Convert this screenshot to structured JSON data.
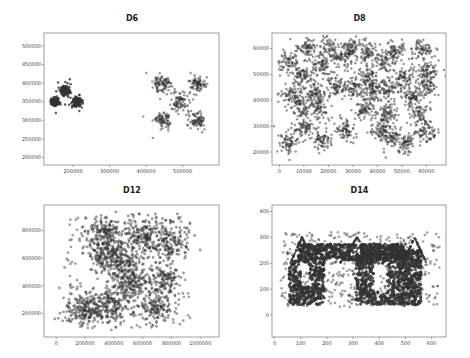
{
  "chart_data": [
    {
      "type": "scatter",
      "title": "D6",
      "xlabel": "",
      "ylabel": "",
      "xlim": [
        120000,
        600000
      ],
      "ylim": [
        180000,
        535000
      ],
      "xticks": [
        200000,
        300000,
        400000,
        500000
      ],
      "yticks": [
        200000,
        250000,
        300000,
        350000,
        400000,
        450000,
        500000
      ],
      "grid": false,
      "clusters": [
        {
          "cx": 150000,
          "cy": 350000,
          "sx": 6000,
          "sy": 6000,
          "n": 120
        },
        {
          "cx": 180000,
          "cy": 380000,
          "sx": 6000,
          "sy": 6000,
          "n": 120
        },
        {
          "cx": 210000,
          "cy": 350000,
          "sx": 6000,
          "sy": 6000,
          "n": 120
        },
        {
          "cx": 445000,
          "cy": 397000,
          "sx": 12000,
          "sy": 12000,
          "n": 90
        },
        {
          "cx": 540000,
          "cy": 400000,
          "sx": 11000,
          "sy": 11000,
          "n": 80
        },
        {
          "cx": 493000,
          "cy": 350000,
          "sx": 12000,
          "sy": 12000,
          "n": 80
        },
        {
          "cx": 445000,
          "cy": 300000,
          "sx": 11000,
          "sy": 11000,
          "n": 80
        },
        {
          "cx": 540000,
          "cy": 300000,
          "sx": 11000,
          "sy": 11000,
          "n": 80
        }
      ]
    },
    {
      "type": "scatter",
      "title": "D8",
      "xlabel": "",
      "ylabel": "",
      "xlim": [
        -3000,
        68000
      ],
      "ylim": [
        15000,
        66000
      ],
      "xticks": [
        0,
        10000,
        20000,
        30000,
        40000,
        50000,
        60000
      ],
      "yticks": [
        20000,
        30000,
        40000,
        50000,
        60000
      ],
      "grid": false,
      "clusters": [
        {
          "cx": 11000,
          "cy": 60000,
          "sx": 2000,
          "sy": 2000,
          "n": 70
        },
        {
          "cx": 20000,
          "cy": 60000,
          "sx": 2000,
          "sy": 2000,
          "n": 70
        },
        {
          "cx": 29000,
          "cy": 60000,
          "sx": 2000,
          "sy": 2000,
          "n": 70
        },
        {
          "cx": 26000,
          "cy": 56500,
          "sx": 2000,
          "sy": 2000,
          "n": 60
        },
        {
          "cx": 36000,
          "cy": 58000,
          "sx": 2000,
          "sy": 2000,
          "n": 70
        },
        {
          "cx": 47000,
          "cy": 59000,
          "sx": 2000,
          "sy": 2000,
          "n": 70
        },
        {
          "cx": 58000,
          "cy": 59000,
          "sx": 2000,
          "sy": 2000,
          "n": 70
        },
        {
          "cx": 4000,
          "cy": 54500,
          "sx": 2000,
          "sy": 2000,
          "n": 70
        },
        {
          "cx": 17000,
          "cy": 53500,
          "sx": 2000,
          "sy": 2000,
          "n": 70
        },
        {
          "cx": 43000,
          "cy": 55000,
          "sx": 2000,
          "sy": 2000,
          "n": 70
        },
        {
          "cx": 10000,
          "cy": 50000,
          "sx": 2000,
          "sy": 2000,
          "n": 70
        },
        {
          "cx": 36000,
          "cy": 49000,
          "sx": 2000,
          "sy": 2000,
          "n": 70
        },
        {
          "cx": 51000,
          "cy": 48500,
          "sx": 2000,
          "sy": 2000,
          "n": 70
        },
        {
          "cx": 60000,
          "cy": 51000,
          "sx": 2000,
          "sy": 2000,
          "n": 70
        },
        {
          "cx": 60000,
          "cy": 45500,
          "sx": 2000,
          "sy": 2000,
          "n": 70
        },
        {
          "cx": 5000,
          "cy": 42000,
          "sx": 2200,
          "sy": 2200,
          "n": 70
        },
        {
          "cx": 14000,
          "cy": 43000,
          "sx": 2000,
          "sy": 2000,
          "n": 70
        },
        {
          "cx": 23500,
          "cy": 45000,
          "sx": 2000,
          "sy": 2000,
          "n": 70
        },
        {
          "cx": 30500,
          "cy": 45000,
          "sx": 2000,
          "sy": 2000,
          "n": 70
        },
        {
          "cx": 38000,
          "cy": 43500,
          "sx": 2000,
          "sy": 2000,
          "n": 70
        },
        {
          "cx": 44000,
          "cy": 45000,
          "sx": 2000,
          "sy": 2000,
          "n": 70
        },
        {
          "cx": 54000,
          "cy": 41500,
          "sx": 2000,
          "sy": 2000,
          "n": 70
        },
        {
          "cx": 9000,
          "cy": 38000,
          "sx": 2000,
          "sy": 2000,
          "n": 70
        },
        {
          "cx": 16000,
          "cy": 37500,
          "sx": 2000,
          "sy": 2000,
          "n": 70
        },
        {
          "cx": 35000,
          "cy": 36500,
          "sx": 2000,
          "sy": 2000,
          "n": 70
        },
        {
          "cx": 44000,
          "cy": 35000,
          "sx": 2000,
          "sy": 2000,
          "n": 70
        },
        {
          "cx": 56500,
          "cy": 35000,
          "sx": 2000,
          "sy": 2000,
          "n": 70
        },
        {
          "cx": 10000,
          "cy": 29500,
          "sx": 2000,
          "sy": 2000,
          "n": 70
        },
        {
          "cx": 27000,
          "cy": 28000,
          "sx": 2000,
          "sy": 2000,
          "n": 70
        },
        {
          "cx": 41000,
          "cy": 29000,
          "sx": 2000,
          "sy": 2000,
          "n": 70
        },
        {
          "cx": 60000,
          "cy": 27500,
          "sx": 2000,
          "sy": 2000,
          "n": 70
        },
        {
          "cx": 4000,
          "cy": 24000,
          "sx": 2000,
          "sy": 2000,
          "n": 70
        },
        {
          "cx": 17500,
          "cy": 25000,
          "sx": 2000,
          "sy": 2000,
          "n": 70
        },
        {
          "cx": 45500,
          "cy": 26000,
          "sx": 2000,
          "sy": 2000,
          "n": 70
        },
        {
          "cx": 51500,
          "cy": 23500,
          "sx": 2000,
          "sy": 2000,
          "n": 70
        }
      ]
    },
    {
      "type": "scatter",
      "title": "D12",
      "xlabel": "",
      "ylabel": "",
      "xlim": [
        -85000,
        1130000
      ],
      "ylim": [
        30000,
        985000
      ],
      "xticks": [
        0,
        200000,
        400000,
        600000,
        800000,
        1000000
      ],
      "yticks": [
        200000,
        400000,
        600000,
        800000
      ],
      "grid": false,
      "clusters": [
        {
          "cx": 200000,
          "cy": 230000,
          "sx": 70000,
          "sy": 60000,
          "n": 200
        },
        {
          "cx": 380000,
          "cy": 250000,
          "sx": 60000,
          "sy": 60000,
          "n": 150
        },
        {
          "cx": 700000,
          "cy": 240000,
          "sx": 50000,
          "sy": 50000,
          "n": 120
        },
        {
          "cx": 530000,
          "cy": 400000,
          "sx": 70000,
          "sy": 70000,
          "n": 200
        },
        {
          "cx": 760000,
          "cy": 450000,
          "sx": 50000,
          "sy": 50000,
          "n": 120
        },
        {
          "cx": 360000,
          "cy": 620000,
          "sx": 60000,
          "sy": 60000,
          "n": 180
        },
        {
          "cx": 340000,
          "cy": 780000,
          "sx": 60000,
          "sy": 50000,
          "n": 160
        },
        {
          "cx": 600000,
          "cy": 760000,
          "sx": 70000,
          "sy": 60000,
          "n": 180
        },
        {
          "cx": 780000,
          "cy": 720000,
          "sx": 60000,
          "sy": 60000,
          "n": 150
        },
        {
          "cx": 480000,
          "cy": 550000,
          "sx": 60000,
          "sy": 60000,
          "n": 120
        }
      ]
    },
    {
      "type": "scatter",
      "title": "D14",
      "xlabel": "",
      "ylabel": "",
      "xlim": [
        -10000,
        655000
      ],
      "ylim": [
        -85000,
        425000
      ],
      "x_scale_note": "tick labels shown in units (x in 0-600, y in 0-400)",
      "xticks": [
        0,
        100,
        200,
        300,
        400,
        500,
        600
      ],
      "yticks": [
        0,
        100,
        200,
        300,
        400
      ],
      "grid": false,
      "description": "Dense dark shapes forming block letters over uniform noise points; arcs on top"
    }
  ],
  "panels": [
    {
      "title": "D6"
    },
    {
      "title": "D8"
    },
    {
      "title": "D12"
    },
    {
      "title": "D14"
    }
  ]
}
